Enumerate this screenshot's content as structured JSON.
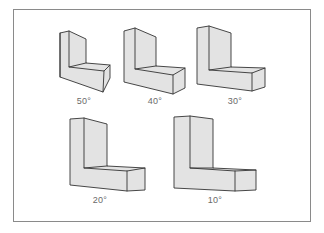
{
  "figure": {
    "colors": {
      "frame": "#8a8a8a",
      "fill": "#e3e3e3",
      "edge": "#333333",
      "label": "#6a6a6a"
    },
    "shapes": [
      {
        "id": "shape-50",
        "label": "50°",
        "label_x": 84,
        "label_y": 96
      },
      {
        "id": "shape-40",
        "label": "40°",
        "label_x": 155,
        "label_y": 96
      },
      {
        "id": "shape-30",
        "label": "30°",
        "label_x": 235,
        "label_y": 96
      },
      {
        "id": "shape-20",
        "label": "20°",
        "label_x": 100,
        "label_y": 195
      },
      {
        "id": "shape-10",
        "label": "10°",
        "label_x": 215,
        "label_y": 195
      }
    ]
  }
}
